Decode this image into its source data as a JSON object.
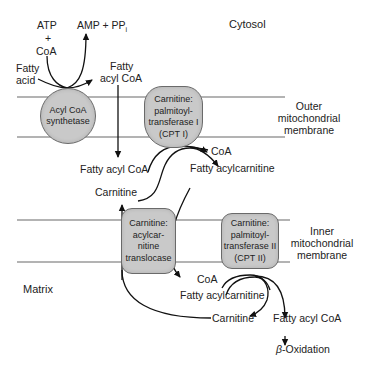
{
  "regions": {
    "cytosol": "Cytosol",
    "matrix": "Matrix",
    "outer_membrane": [
      "Outer",
      "mitochondrial",
      "membrane"
    ],
    "inner_membrane": [
      "Inner",
      "mitochondrial",
      "membrane"
    ]
  },
  "enzymes": {
    "acyl_coa_synthetase": [
      "Acyl CoA",
      "synthetase"
    ],
    "cpt1": [
      "Carnitine:",
      "palmitoyl-",
      "transferase I",
      "(CPT I)"
    ],
    "translocase": [
      "Carnitine:",
      "acylcar-",
      "nitine",
      "translocase"
    ],
    "cpt2": [
      "Carnitine:",
      "palmitoyl-",
      "transferase II",
      "(CPT II)"
    ]
  },
  "metabolites": {
    "atp": "ATP",
    "plus": "+",
    "coa_top": "CoA",
    "amp_ppi": "AMP + PP",
    "amp_ppi_sub": "i",
    "fatty_acid": [
      "Fatty",
      "acid"
    ],
    "fatty_acyl_coa_top": [
      "Fatty",
      "acyl CoA"
    ],
    "fatty_acyl_coa_mid": "Fatty acyl CoA",
    "coa_cpt1": "CoA",
    "fatty_acylcarnitine_mid": "Fatty acylcarnitine",
    "carnitine_mid": "Carnitine",
    "coa_cpt2": "CoA",
    "fatty_acylcarnitine_matrix": "Fatty acylcarnitine",
    "carnitine_matrix": "Carnitine",
    "fatty_acyl_coa_matrix": "Fatty acyl CoA",
    "beta_symbol": "β",
    "beta_oxidation": "-Oxidation"
  },
  "colors": {
    "membrane_line": "#9a9a9a",
    "enzyme_fill": "#c9c9c9",
    "enzyme_border": "#6a6a6a",
    "arrow": "#111111"
  }
}
